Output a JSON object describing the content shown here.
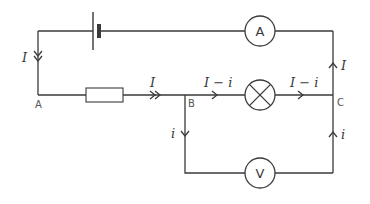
{
  "diagram": {
    "type": "electric-circuit",
    "components": {
      "battery": {
        "symbol": "battery-icon"
      },
      "ammeter": {
        "label": "A"
      },
      "resistor": {
        "symbol": "resistor"
      },
      "lamp": {
        "symbol": "lamp-icon"
      },
      "voltmeter": {
        "label": "V"
      }
    },
    "nodes": {
      "a": "A",
      "b": "B",
      "c": "C"
    },
    "currents": {
      "left_branch": "I",
      "before_b": "I",
      "b_to_lamp": "I − i",
      "lamp_to_c": "I − i",
      "b_down": "i",
      "right_upper": "I",
      "right_lower": "i"
    },
    "colors": {
      "line": "#3a3a3a",
      "node_label": "#555555",
      "background": "#ffffff"
    }
  }
}
